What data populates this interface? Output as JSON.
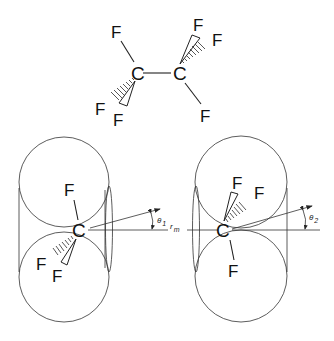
{
  "molecule": {
    "name_hint": "tetrafluoroethane (C2F4 staggered view)",
    "atoms": {
      "c_left": "C",
      "c_right": "C",
      "f_left_top": "F",
      "f_left_hash": "F",
      "f_left_wedge": "F",
      "f_right_wedge": "F",
      "f_right_hash": "F",
      "f_right_bottom": "F"
    }
  },
  "lower_left": {
    "carbon": "C",
    "f_top": "F",
    "f_hash": "F",
    "f_wedge": "F",
    "angle_symbol": "θ",
    "angle_subscript": "1"
  },
  "lower_right": {
    "carbon": "C",
    "f_wedge": "F",
    "f_hash": "F",
    "f_bottom": "F",
    "angle_symbol": "θ",
    "angle_subscript": "2"
  },
  "axis": {
    "distance_symbol": "r",
    "distance_subscript": "m"
  },
  "colors": {
    "line": "#333333",
    "text": "#111111",
    "background": "#ffffff"
  }
}
